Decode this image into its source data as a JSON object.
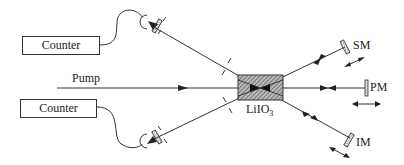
{
  "diagram": {
    "type": "optical-setup",
    "counters": [
      {
        "label": "Counter"
      },
      {
        "label": "Counter"
      }
    ],
    "pump_label": "Pump",
    "crystal": {
      "label_main": "LiIO",
      "label_sub": "3"
    },
    "mirrors": [
      {
        "id": "SM",
        "label": "SM"
      },
      {
        "id": "PM",
        "label": "PM"
      },
      {
        "id": "IM",
        "label": "IM"
      }
    ],
    "colors": {
      "line": "#333333",
      "background": "#ffffff",
      "hatch": "#555555"
    }
  }
}
